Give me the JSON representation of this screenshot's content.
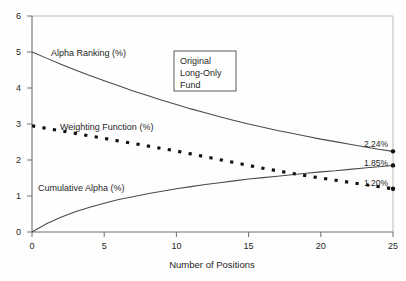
{
  "chart_data": {
    "type": "line",
    "title": "",
    "xlabel": "Number of Positions",
    "ylabel": "",
    "xlim": [
      0,
      25
    ],
    "ylim": [
      0,
      6
    ],
    "grid": false,
    "legend_position": "inline-labels",
    "xticks": [
      "0",
      "5",
      "10",
      "15",
      "20",
      "25"
    ],
    "xtick_values": [
      0,
      5,
      10,
      15,
      20,
      25
    ],
    "yticks": [
      "0",
      "1",
      "2",
      "3",
      "4",
      "5",
      "6"
    ],
    "ytick_values": [
      0,
      1,
      2,
      3,
      4,
      5,
      6
    ],
    "x": [
      0,
      1,
      2,
      3,
      4,
      5,
      6,
      7,
      8,
      9,
      10,
      11,
      12,
      13,
      14,
      15,
      16,
      17,
      18,
      19,
      20,
      21,
      22,
      23,
      24,
      25
    ],
    "series": [
      {
        "name": "Alpha Ranking (%)",
        "style": "solid",
        "values": [
          5.0,
          4.83,
          4.66,
          4.5,
          4.35,
          4.2,
          4.06,
          3.92,
          3.79,
          3.66,
          3.54,
          3.42,
          3.31,
          3.2,
          3.1,
          3.0,
          2.91,
          2.82,
          2.74,
          2.66,
          2.58,
          2.51,
          2.44,
          2.37,
          2.3,
          2.24
        ],
        "end_label": "2.24%",
        "end_value": 2.24
      },
      {
        "name": "Cumulative Alpha (%)",
        "style": "solid",
        "values": [
          0.0,
          0.23,
          0.41,
          0.56,
          0.69,
          0.8,
          0.9,
          0.98,
          1.06,
          1.13,
          1.2,
          1.26,
          1.32,
          1.37,
          1.42,
          1.47,
          1.51,
          1.55,
          1.59,
          1.63,
          1.67,
          1.7,
          1.74,
          1.78,
          1.81,
          1.85
        ],
        "end_label": "1.85%",
        "end_value": 1.85
      },
      {
        "name": "Weighting Function (%)",
        "style": "dashed",
        "values": [
          2.95,
          2.88,
          2.81,
          2.74,
          2.67,
          2.6,
          2.53,
          2.46,
          2.39,
          2.32,
          2.25,
          2.17,
          2.09,
          2.01,
          1.93,
          1.85,
          1.77,
          1.7,
          1.63,
          1.56,
          1.5,
          1.44,
          1.38,
          1.32,
          1.26,
          1.2
        ],
        "end_label": "1.20%",
        "end_value": 1.2
      }
    ],
    "annotations": [
      {
        "text": "Alpha Ranking (%)",
        "kind": "series-label"
      },
      {
        "text": "Weighting Function (%)",
        "kind": "series-label"
      },
      {
        "text": "Cumulative Alpha (%)",
        "kind": "series-label"
      }
    ],
    "callout": {
      "line1": "Original",
      "line2": "Long-Only",
      "line3": "Fund"
    },
    "colors": {
      "solid_curve": "#4a4a4a",
      "dashed_curve": "#111111",
      "axis": "#6e6e6e",
      "frame": "#b9b9b9",
      "text": "#1f1f1f",
      "background": "#fefefe"
    }
  }
}
